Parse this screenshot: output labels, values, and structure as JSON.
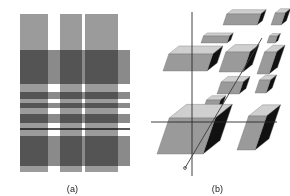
{
  "figure": {
    "panels": [
      {
        "id": "a",
        "caption": "(a)",
        "type": "plaid-grid",
        "description": "Overlapping gray vertical columns and horizontal bands forming a plaid lattice",
        "background": "#ffffff"
      },
      {
        "id": "b",
        "caption": "(b)",
        "type": "isometric-blocks",
        "description": "Exploded isometric view of rectangular slabs arranged around crossed axis lines with a diagonal",
        "background": "#ffffff"
      }
    ]
  },
  "panel_a": {
    "stage": {
      "x": 20,
      "y": 14,
      "width": 110,
      "height": 158
    },
    "colors": {
      "light": "#b9b9b9",
      "medium": "#8f8f8f",
      "dark": "#4f4f4f",
      "very_dark": "#2b2b2b",
      "pale": "#d2d2d2",
      "white": "#ffffff"
    },
    "vertical_stripes": [
      {
        "name": "column-1",
        "x": 0,
        "width": 28,
        "color": "#9b9b9b"
      },
      {
        "name": "column-2",
        "x": 40,
        "width": 22,
        "color": "#9b9b9b"
      },
      {
        "name": "column-3",
        "x": 65,
        "width": 33,
        "color": "#9b9b9b"
      }
    ],
    "horizontal_stripes": [
      {
        "name": "band-1",
        "y": 36,
        "height": 34,
        "color": "#8a8a8a"
      },
      {
        "name": "band-2",
        "y": 78,
        "height": 7,
        "color": "#8a8a8a"
      },
      {
        "name": "band-3",
        "y": 89,
        "height": 5,
        "color": "#8a8a8a"
      },
      {
        "name": "band-4",
        "y": 100,
        "height": 9,
        "color": "#8a8a8a"
      },
      {
        "name": "band-5",
        "y": 114,
        "height": 2,
        "color": "#5a5a5a"
      },
      {
        "name": "band-6",
        "y": 122,
        "height": 30,
        "color": "#8a8a8a"
      }
    ]
  },
  "panel_b": {
    "stage": {
      "width": 145,
      "height": 196
    },
    "colors": {
      "top_face": "#cfcfcf",
      "front_face": "#9a9a9a",
      "side_face": "#111111",
      "axis_line": "#2a2a2a",
      "diagonal_line": "#3a3a3a"
    },
    "axes": [
      {
        "name": "vertical-axis",
        "x1": 47,
        "y1": 12,
        "x2": 47,
        "y2": 176
      },
      {
        "name": "horizontal-axis",
        "x1": 6,
        "y1": 122,
        "x2": 132,
        "y2": 122
      },
      {
        "name": "diagonal-axis",
        "x1": 117,
        "y1": 38,
        "x2": 40,
        "y2": 168
      }
    ],
    "blocks": [
      {
        "name": "block-top-left-upper",
        "x": 78,
        "y": 14,
        "w": 34,
        "h": 11,
        "depth": 7
      },
      {
        "name": "block-top-right-upper",
        "x": 126,
        "y": 13,
        "w": 10,
        "h": 12,
        "depth": 7
      },
      {
        "name": "block-top-left-lower",
        "x": 56,
        "y": 36,
        "w": 26,
        "h": 7,
        "depth": 5
      },
      {
        "name": "block-top-right-lower",
        "x": 122,
        "y": 36,
        "w": 8,
        "h": 7,
        "depth": 4
      },
      {
        "name": "block-mid-left-large",
        "x": 18,
        "y": 54,
        "w": 44,
        "h": 17,
        "depth": 13
      },
      {
        "name": "block-mid-center",
        "x": 74,
        "y": 52,
        "w": 24,
        "h": 20,
        "depth": 12
      },
      {
        "name": "block-mid-right",
        "x": 112,
        "y": 52,
        "w": 12,
        "h": 22,
        "depth": 11
      },
      {
        "name": "block-mid-center-low",
        "x": 72,
        "y": 82,
        "w": 22,
        "h": 12,
        "depth": 9
      },
      {
        "name": "block-mid-right-low",
        "x": 110,
        "y": 80,
        "w": 11,
        "h": 13,
        "depth": 8
      },
      {
        "name": "block-center-small",
        "x": 58,
        "y": 100,
        "w": 14,
        "h": 10,
        "depth": 7
      },
      {
        "name": "block-bottom-large",
        "x": 12,
        "y": 118,
        "w": 46,
        "h": 36,
        "depth": 22
      },
      {
        "name": "block-bottom-right",
        "x": 92,
        "y": 116,
        "w": 18,
        "h": 34,
        "depth": 18
      }
    ]
  }
}
